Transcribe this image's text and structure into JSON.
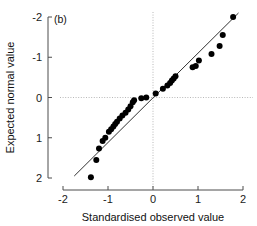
{
  "figure": {
    "panel_label": "(b)",
    "background": "#ffffff",
    "point_color": "#000000",
    "line_color": "#1a1a1a",
    "grid_color": "#b0b0b0"
  },
  "axes": {
    "x_title": "Standardised observed value",
    "y_title": "Expected normal value",
    "x_ticks": [
      "-2",
      "-1",
      "0",
      "1",
      "2"
    ],
    "y_ticks": [
      "2",
      "1",
      "0",
      "-1",
      "-2"
    ]
  },
  "chart_data": {
    "type": "scatter",
    "title": "(b)",
    "xlabel": "Standardised observed value",
    "ylabel": "Expected normal value",
    "xlim": [
      -2,
      2
    ],
    "ylim": [
      -2,
      2
    ],
    "x_ticks": [
      -2,
      -1,
      0,
      1,
      2
    ],
    "y_ticks": [
      -2,
      -1,
      0,
      1,
      2
    ],
    "grid": false,
    "legend": "none",
    "reference_lines": [
      {
        "name": "identity-line",
        "type": "line",
        "x0": -1.75,
        "y0": -1.95,
        "x1": 1.9,
        "y1": 2.1,
        "style": "solid"
      },
      {
        "name": "zero-horizontal",
        "type": "hline",
        "y": 0,
        "style": "dotted"
      },
      {
        "name": "zero-vertical",
        "type": "vline",
        "x": 0,
        "style": "dotted"
      }
    ],
    "x": [
      -1.38,
      -1.26,
      -1.2,
      -1.12,
      -1.06,
      -0.98,
      -0.93,
      -0.88,
      -0.84,
      -0.8,
      -0.74,
      -0.68,
      -0.61,
      -0.55,
      -0.5,
      -0.45,
      -0.42,
      -0.26,
      -0.15,
      0.06,
      0.22,
      0.32,
      0.38,
      0.42,
      0.46,
      0.5,
      0.88,
      0.95,
      1.02,
      1.3,
      1.48,
      1.55,
      1.78
    ],
    "y": [
      -1.98,
      -1.55,
      -1.27,
      -1.08,
      -1.0,
      -0.85,
      -0.79,
      -0.72,
      -0.66,
      -0.6,
      -0.52,
      -0.45,
      -0.38,
      -0.3,
      -0.22,
      -0.12,
      -0.07,
      -0.02,
      0.0,
      0.1,
      0.22,
      0.3,
      0.36,
      0.42,
      0.47,
      0.53,
      0.75,
      0.78,
      0.92,
      1.08,
      1.28,
      1.55,
      2.0
    ],
    "series": [
      {
        "name": "qq-points",
        "points": [
          [
            -1.38,
            -1.98
          ],
          [
            -1.26,
            -1.55
          ],
          [
            -1.2,
            -1.27
          ],
          [
            -1.12,
            -1.08
          ],
          [
            -1.06,
            -1.0
          ],
          [
            -0.98,
            -0.85
          ],
          [
            -0.93,
            -0.79
          ],
          [
            -0.88,
            -0.72
          ],
          [
            -0.84,
            -0.66
          ],
          [
            -0.8,
            -0.6
          ],
          [
            -0.74,
            -0.52
          ],
          [
            -0.68,
            -0.45
          ],
          [
            -0.61,
            -0.38
          ],
          [
            -0.55,
            -0.3
          ],
          [
            -0.5,
            -0.22
          ],
          [
            -0.45,
            -0.12
          ],
          [
            -0.42,
            -0.07
          ],
          [
            -0.26,
            -0.02
          ],
          [
            -0.15,
            0.0
          ],
          [
            0.06,
            0.1
          ],
          [
            0.22,
            0.22
          ],
          [
            0.32,
            0.3
          ],
          [
            0.38,
            0.36
          ],
          [
            0.42,
            0.42
          ],
          [
            0.46,
            0.47
          ],
          [
            0.5,
            0.53
          ],
          [
            0.88,
            0.75
          ],
          [
            0.95,
            0.78
          ],
          [
            1.02,
            0.92
          ],
          [
            1.3,
            1.08
          ],
          [
            1.48,
            1.28
          ],
          [
            1.55,
            1.55
          ],
          [
            1.78,
            2.0
          ]
        ]
      }
    ]
  }
}
